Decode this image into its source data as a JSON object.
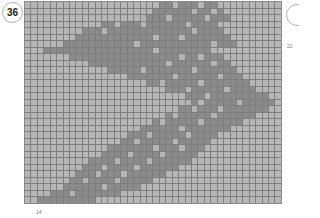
{
  "badge": {
    "number": "36"
  },
  "labels": {
    "right": "22",
    "bottom": "14"
  },
  "grid": {
    "cols": 40,
    "rows": 31,
    "colors": {
      "light": "#b6b6b6",
      "dark": "#8b8b8b",
      "line": "#7e7e7e"
    },
    "band": {
      "description": "chevron-shaped dark band pointing right",
      "rows": [
        [
          21,
          29
        ],
        [
          20,
          30
        ],
        [
          19,
          31
        ],
        [
          12,
          29
        ],
        [
          9,
          30
        ],
        [
          8,
          31
        ],
        [
          6,
          32
        ],
        [
          3,
          28
        ],
        [
          7,
          30
        ],
        [
          10,
          31
        ],
        [
          13,
          32
        ],
        [
          16,
          33
        ],
        [
          19,
          34
        ],
        [
          22,
          35
        ],
        [
          24,
          37
        ],
        [
          26,
          38
        ],
        [
          24,
          37
        ],
        [
          22,
          35
        ],
        [
          20,
          33
        ],
        [
          18,
          31
        ],
        [
          16,
          29
        ],
        [
          15,
          28
        ],
        [
          13,
          27
        ],
        [
          12,
          26
        ],
        [
          10,
          25
        ],
        [
          9,
          23
        ],
        [
          8,
          21
        ],
        [
          7,
          19
        ],
        [
          6,
          17
        ],
        [
          4,
          14
        ],
        [
          2,
          10
        ]
      ],
      "holes": [
        [
          0,
          23
        ],
        [
          0,
          27
        ],
        [
          1,
          26
        ],
        [
          1,
          29
        ],
        [
          2,
          22
        ],
        [
          2,
          28
        ],
        [
          3,
          14
        ],
        [
          3,
          18
        ],
        [
          3,
          25
        ],
        [
          4,
          12
        ],
        [
          4,
          26
        ],
        [
          5,
          20
        ],
        [
          5,
          24
        ],
        [
          6,
          17
        ],
        [
          6,
          29
        ],
        [
          7,
          20
        ],
        [
          8,
          24
        ],
        [
          8,
          27
        ],
        [
          9,
          22
        ],
        [
          9,
          29
        ],
        [
          10,
          18
        ],
        [
          10,
          26
        ],
        [
          11,
          23
        ],
        [
          11,
          30
        ],
        [
          12,
          21
        ],
        [
          12,
          27
        ],
        [
          13,
          25
        ],
        [
          13,
          31
        ],
        [
          14,
          24
        ],
        [
          14,
          28
        ],
        [
          15,
          27
        ],
        [
          15,
          33
        ],
        [
          16,
          26
        ],
        [
          16,
          30
        ],
        [
          17,
          23
        ],
        [
          17,
          29
        ],
        [
          18,
          21
        ],
        [
          18,
          27
        ],
        [
          19,
          24
        ],
        [
          20,
          19
        ],
        [
          20,
          25
        ],
        [
          21,
          17
        ],
        [
          21,
          23
        ],
        [
          22,
          20
        ],
        [
          22,
          24
        ],
        [
          23,
          16
        ],
        [
          23,
          21
        ],
        [
          24,
          14
        ],
        [
          24,
          19
        ],
        [
          25,
          12
        ],
        [
          25,
          17
        ],
        [
          26,
          11
        ],
        [
          26,
          15
        ],
        [
          27,
          9
        ],
        [
          27,
          14
        ],
        [
          28,
          12
        ],
        [
          29,
          7
        ]
      ]
    }
  }
}
